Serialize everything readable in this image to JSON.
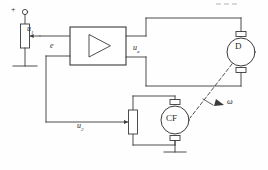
{
  "diagram": {
    "type": "electrical-schematic",
    "stroke_color": "#3a3a3a",
    "background_color": "#fefefe"
  },
  "labels": {
    "input_terminal_plus": "+",
    "input_voltage": "u",
    "input_voltage_sub": "1",
    "error_signal": "e",
    "amplifier_output": "u",
    "amplifier_output_sub": "a",
    "feedback_voltage": "u",
    "feedback_voltage_sub": "2",
    "motor": "D",
    "tachogenerator": "CF",
    "angular_speed": "ω"
  },
  "components": {
    "input_potentiometer": "input-potentiometer",
    "amplifier": "amplifier-block",
    "amplifier_symbol": "triangle-gain-symbol",
    "motor": "dc-motor",
    "tachogenerator": "tachogenerator",
    "feedback_potentiometer": "feedback-potentiometer",
    "ground_input": "ground-symbol",
    "ground_tacho": "ground-symbol",
    "shaft_coupling": "dashed-mechanical-shaft",
    "speed_arrow": "omega-arrow"
  }
}
